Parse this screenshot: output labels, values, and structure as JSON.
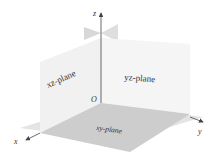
{
  "diagram": {
    "type": "3d-coordinate-planes",
    "axes": {
      "x": {
        "label": "x"
      },
      "y": {
        "label": "y"
      },
      "z": {
        "label": "z"
      }
    },
    "origin": {
      "label": "O"
    },
    "planes": {
      "xz": {
        "label": "xz-plane",
        "color": "#f2f2f2"
      },
      "yz": {
        "label": "yz-plane",
        "color": "#f4f4f4"
      },
      "xy": {
        "label": "xy-plane",
        "color": "#cfcfcf",
        "back_color": "#e2e2e2"
      }
    },
    "colors": {
      "axis": "#444444",
      "back_wedge": "#d6d6d6",
      "background": "#ffffff"
    }
  }
}
